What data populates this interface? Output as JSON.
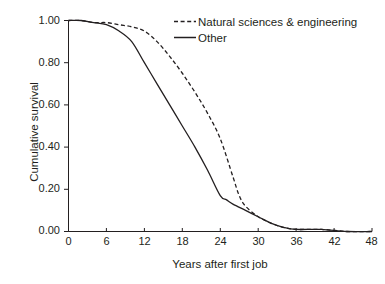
{
  "chart_data": {
    "type": "line",
    "title": "",
    "subtitle": "",
    "xlabel": "Years after first job",
    "ylabel": "Cumulative survival",
    "xlim": [
      0,
      48
    ],
    "ylim": [
      0.0,
      1.0
    ],
    "xticks": [
      0,
      6,
      12,
      18,
      24,
      30,
      36,
      42,
      48
    ],
    "xtick_labels": [
      "0",
      "6",
      "12",
      "18",
      "24",
      "30",
      "36",
      "42",
      "48"
    ],
    "yticks": [
      0.0,
      0.2,
      0.4,
      0.6,
      0.8,
      1.0
    ],
    "ytick_labels": [
      "0.00",
      "0.20",
      "0.40",
      "0.60",
      "0.80",
      "1.00"
    ],
    "grid": false,
    "legend_position": "top-right",
    "series": [
      {
        "name": "Natural sciences & engineering",
        "style": "dashed",
        "color": "#231f20",
        "x": [
          0,
          2,
          4,
          6,
          8,
          10,
          12,
          14,
          16,
          18,
          20,
          22,
          24,
          26,
          27,
          28,
          30,
          32,
          34,
          36,
          40,
          44,
          48
        ],
        "values": [
          1.0,
          1.0,
          0.99,
          0.99,
          0.98,
          0.97,
          0.95,
          0.9,
          0.83,
          0.75,
          0.66,
          0.56,
          0.44,
          0.26,
          0.17,
          0.12,
          0.07,
          0.04,
          0.02,
          0.01,
          0.01,
          0.0,
          0.0
        ]
      },
      {
        "name": "Other",
        "style": "solid",
        "color": "#231f20",
        "x": [
          0,
          2,
          4,
          6,
          8,
          10,
          12,
          14,
          16,
          18,
          20,
          22,
          24,
          25,
          26,
          28,
          30,
          32,
          34,
          36,
          40,
          44,
          48
        ],
        "values": [
          1.0,
          1.0,
          0.99,
          0.98,
          0.95,
          0.9,
          0.8,
          0.7,
          0.6,
          0.5,
          0.4,
          0.29,
          0.17,
          0.15,
          0.13,
          0.1,
          0.07,
          0.04,
          0.02,
          0.01,
          0.01,
          0.0,
          0.0
        ]
      }
    ]
  },
  "legend": {
    "items": [
      {
        "label": "Natural sciences & engineering",
        "style": "dashed"
      },
      {
        "label": "Other",
        "style": "solid"
      }
    ]
  },
  "axes": {
    "x_title": "Years after first job",
    "y_title": "Cumulative survival",
    "x_labels": [
      "0",
      "6",
      "12",
      "18",
      "24",
      "30",
      "36",
      "42",
      "48"
    ],
    "y_labels": [
      "1.00",
      "0.80",
      "0.60",
      "0.40",
      "0.20",
      "0.00"
    ]
  },
  "colors": {
    "ink": "#231f20",
    "background": "#ffffff"
  }
}
